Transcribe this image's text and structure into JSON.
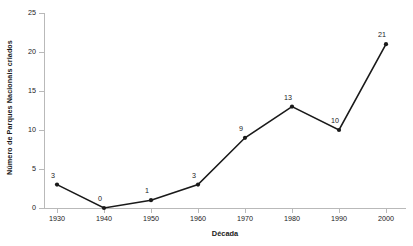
{
  "chart_data": {
    "type": "line",
    "title": "",
    "xlabel": "Década",
    "ylabel": "Número de Parques Nacionais criados",
    "categories": [
      "1930",
      "1940",
      "1950",
      "1960",
      "1970",
      "1980",
      "1990",
      "2000"
    ],
    "values": [
      3,
      0,
      1,
      3,
      9,
      13,
      10,
      21
    ],
    "point_labels": [
      "3",
      "0",
      "1",
      "3",
      "9",
      "13",
      "10",
      "21"
    ],
    "ylim": [
      0,
      25
    ],
    "yticks": [
      "0",
      "5",
      "10",
      "15",
      "20",
      "25"
    ],
    "xticks": [
      "1930",
      "1940",
      "1950",
      "1960",
      "1970",
      "1980",
      "1990",
      "2000"
    ],
    "grid": false,
    "legend": false,
    "legend_position": "none",
    "series": [
      {
        "name": "Parques Nacionais criados",
        "values": [
          3,
          0,
          1,
          3,
          9,
          13,
          10,
          21
        ]
      }
    ],
    "colors": {
      "line": "#1a1a1a",
      "marker": "#1a1a1a",
      "axis": "#b9b9b9",
      "text": "#1a1a1a",
      "background": "#ffffff"
    }
  }
}
